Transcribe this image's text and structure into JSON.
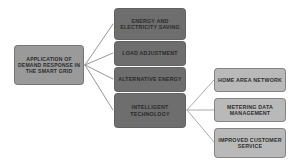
{
  "diagram": {
    "type": "tree-flowchart",
    "background_color": "#ffffff",
    "root": {
      "id": "root",
      "label": "APPLICATION OF DEMAND RESPONSE IN THE SMART GRID",
      "fill_color": "#9a9a9a"
    },
    "branches": [
      {
        "id": "energy-saving",
        "label": "ENERGY AND ELECTRICITY SAVING",
        "fill_color": "#6e6e6e"
      },
      {
        "id": "load-adjustment",
        "label": "LOAD ADJUSTMENT",
        "fill_color": "#6e6e6e"
      },
      {
        "id": "alternative-energy",
        "label": "ALTERNATIVE ENERGY",
        "fill_color": "#6e6e6e"
      },
      {
        "id": "intelligent-technology",
        "label": "INTELLIGENT TECHNOLOGY",
        "fill_color": "#6e6e6e"
      }
    ],
    "sub_branches": [
      {
        "id": "home-area-network",
        "label": "HOME AREA NETWORK",
        "fill_color": "#b9b9b9"
      },
      {
        "id": "metering-data-management",
        "label": "METERING DATA MANAGEMENT",
        "fill_color": "#b9b9b9"
      },
      {
        "id": "improved-customer-service",
        "label": "IMPROVED CUSTOMER SERVICE",
        "fill_color": "#b9b9b9"
      }
    ],
    "connector_color": "#8a8a8a"
  }
}
